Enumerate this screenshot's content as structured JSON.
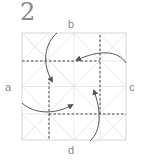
{
  "step": {
    "number": "2"
  },
  "labels": {
    "top": "b",
    "left": "a",
    "right": "c",
    "bottom": "d"
  },
  "diagram": {
    "type": "origami-fold-step",
    "square": {
      "x": 22,
      "y": 33,
      "size": 104
    },
    "crease_color": "#dcdcdc",
    "fold_line_color": "#555555",
    "arrow_color": "#555555",
    "fold_lines": [
      {
        "orientation": "horizontal",
        "description": "upper valley fold"
      },
      {
        "orientation": "horizontal",
        "description": "lower valley fold"
      },
      {
        "orientation": "vertical",
        "description": "left valley fold"
      },
      {
        "orientation": "vertical",
        "description": "right valley fold"
      }
    ],
    "arrows": [
      {
        "from": "b",
        "direction": "down"
      },
      {
        "from": "c",
        "direction": "left"
      },
      {
        "from": "d",
        "direction": "up"
      },
      {
        "from": "a",
        "direction": "right"
      }
    ]
  }
}
